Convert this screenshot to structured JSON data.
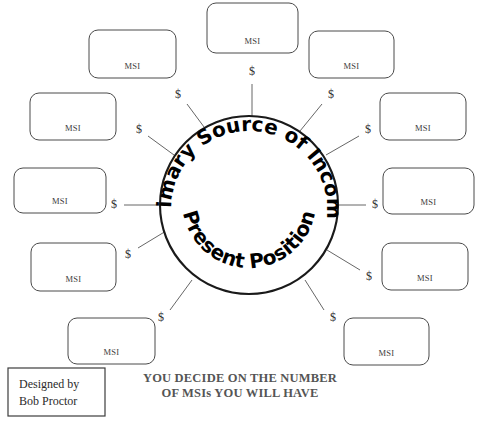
{
  "diagram": {
    "title_top": "Primary Source of Income",
    "title_bottom": "Present Position",
    "hub": {
      "cx": 249,
      "cy": 205,
      "r": 89
    },
    "currency_symbol": "$",
    "node_label": "MSI",
    "nodes": [
      {
        "id": "msi-top",
        "label": "MSI",
        "x": 207,
        "y": 3,
        "w": 91,
        "h": 50,
        "dollar_x": 252,
        "dollar_y": 72,
        "spoke_x1": 252,
        "spoke_y1": 84,
        "spoke_x2": 252,
        "spoke_y2": 116
      },
      {
        "id": "msi-top-left",
        "label": "MSI",
        "x": 89,
        "y": 30,
        "w": 87,
        "h": 48,
        "dollar_x": 178,
        "dollar_y": 95,
        "spoke_x1": 187,
        "spoke_y1": 104,
        "spoke_x2": 207,
        "spoke_y2": 131
      },
      {
        "id": "msi-top-right",
        "label": "MSI",
        "x": 309,
        "y": 31,
        "w": 85,
        "h": 47,
        "dollar_x": 331,
        "dollar_y": 95,
        "spoke_x1": 322,
        "spoke_y1": 104,
        "spoke_x2": 300,
        "spoke_y2": 131
      },
      {
        "id": "msi-upper-left",
        "label": "MSI",
        "x": 30,
        "y": 93,
        "w": 86,
        "h": 47,
        "dollar_x": 139,
        "dollar_y": 130,
        "spoke_x1": 148,
        "spoke_y1": 136,
        "spoke_x2": 174,
        "spoke_y2": 155
      },
      {
        "id": "msi-upper-right",
        "label": "MSI",
        "x": 380,
        "y": 93,
        "w": 86,
        "h": 47,
        "dollar_x": 368,
        "dollar_y": 130,
        "spoke_x1": 359,
        "spoke_y1": 136,
        "spoke_x2": 326,
        "spoke_y2": 155
      },
      {
        "id": "msi-mid-left",
        "label": "MSI",
        "x": 14,
        "y": 168,
        "w": 92,
        "h": 45,
        "dollar_x": 114,
        "dollar_y": 205,
        "spoke_x1": 124,
        "spoke_y1": 205,
        "spoke_x2": 160,
        "spoke_y2": 205
      },
      {
        "id": "msi-mid-right",
        "label": "MSI",
        "x": 383,
        "y": 168,
        "w": 91,
        "h": 46,
        "dollar_x": 375,
        "dollar_y": 205,
        "spoke_x1": 366,
        "spoke_y1": 205,
        "spoke_x2": 338,
        "spoke_y2": 205
      },
      {
        "id": "msi-lower-left",
        "label": "MSI",
        "x": 31,
        "y": 243,
        "w": 85,
        "h": 48,
        "dollar_x": 128,
        "dollar_y": 255,
        "spoke_x1": 138,
        "spoke_y1": 248,
        "spoke_x2": 171,
        "spoke_y2": 228
      },
      {
        "id": "msi-lower-right",
        "label": "MSI",
        "x": 382,
        "y": 243,
        "w": 86,
        "h": 47,
        "dollar_x": 369,
        "dollar_y": 277,
        "spoke_x1": 360,
        "spoke_y1": 270,
        "spoke_x2": 327,
        "spoke_y2": 250
      },
      {
        "id": "msi-bottom-left",
        "label": "MSI",
        "x": 68,
        "y": 318,
        "w": 87,
        "h": 46,
        "dollar_x": 161,
        "dollar_y": 318,
        "spoke_x1": 170,
        "spoke_y1": 310,
        "spoke_x2": 192,
        "spoke_y2": 280
      },
      {
        "id": "msi-bottom-right",
        "label": "MSI",
        "x": 344,
        "y": 318,
        "w": 85,
        "h": 47,
        "dollar_x": 333,
        "dollar_y": 318,
        "spoke_x1": 324,
        "spoke_y1": 310,
        "spoke_x2": 305,
        "spoke_y2": 280
      },
      {
        "id": "msi-bottom-right-upper",
        "label": "MSI",
        "x": 368,
        "y": 256,
        "w": 0,
        "h": 0,
        "dollar_x": 0,
        "dollar_y": 0,
        "spoke_x1": 0,
        "spoke_y1": 0,
        "spoke_x2": 0,
        "spoke_y2": 0
      }
    ]
  },
  "caption": {
    "line1": "YOU DECIDE ON THE NUMBER",
    "line2": "OF MSIs YOU WILL HAVE"
  },
  "credit": {
    "line1": "Designed by",
    "line2": "Bob Proctor",
    "x": 8,
    "y": 368,
    "w": 97,
    "h": 48
  },
  "colors": {
    "ink": "#000000",
    "box_stroke": "#4a4a4a",
    "caption": "#555555",
    "background": "#ffffff"
  }
}
